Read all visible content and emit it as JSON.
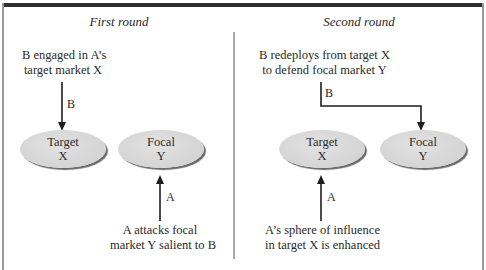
{
  "panels": [
    {
      "heading": "First round",
      "top_label": [
        "B engaged in A’s",
        "target market X"
      ],
      "bottom_label": [
        "A attacks focal",
        "market Y salient to B"
      ],
      "arrow_top_label": "B",
      "arrow_bottom_label": "A",
      "nodes": [
        {
          "line1": "Target",
          "line2": "X"
        },
        {
          "line1": "Focal",
          "line2": "Y"
        }
      ]
    },
    {
      "heading": "Second round",
      "top_label": [
        "B redeploys from target X",
        "to defend focal market Y"
      ],
      "bottom_label": [
        "A’s sphere of influence",
        "in target X is enhanced"
      ],
      "arrow_top_label": "B",
      "arrow_bottom_label": "A",
      "nodes": [
        {
          "line1": "Target",
          "line2": "X"
        },
        {
          "line1": "Focal",
          "line2": "Y"
        }
      ]
    }
  ],
  "colors": {
    "node_fill": "#d6d6d6",
    "node_shadow": "#6a6a6a",
    "frame_top": "#2e2e2e",
    "frame_side": "#9a9a9a",
    "arrow": "#1e1e1e"
  }
}
